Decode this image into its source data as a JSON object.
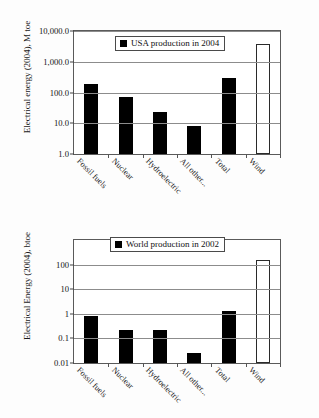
{
  "chart_data": [
    {
      "id": "usa-2004",
      "type": "bar",
      "title": "",
      "legend": "USA production in 2004",
      "legend_position": "top-left-inside",
      "xlabel": "",
      "ylabel": "Electrical energy (2004), M toe",
      "yscale": "log",
      "ylim": [
        1.0,
        10000.0
      ],
      "grid": true,
      "yticks": [
        "1.0",
        "10.0",
        "100.0",
        "1,000.0",
        "10,000.0"
      ],
      "ytick_values": [
        1.0,
        10.0,
        100.0,
        1000.0,
        10000.0
      ],
      "categories": [
        "Fossil fuels",
        "Nuclear",
        "Hydroelectric",
        "All other...",
        "Total",
        "Wind"
      ],
      "values": [
        190,
        70,
        24,
        8,
        290,
        3800
      ],
      "bar_styles": [
        "filled",
        "filled",
        "filled",
        "filled",
        "filled",
        "hollow"
      ]
    },
    {
      "id": "world-2002",
      "type": "bar",
      "title": "",
      "legend": "World production in 2002",
      "legend_position": "top-left-inside",
      "xlabel": "",
      "ylabel": "Electrical Energy (2004), btoe",
      "yscale": "log",
      "ylim": [
        0.01,
        1000
      ],
      "grid": true,
      "yticks": [
        "0.01",
        "0.1",
        "1",
        "10",
        "100"
      ],
      "ytick_values": [
        0.01,
        0.1,
        1,
        10,
        100
      ],
      "categories": [
        "Fossil fuels",
        "Nuclear",
        "Hydroelectric",
        "All other...",
        "Total",
        "Wind"
      ],
      "values": [
        0.85,
        0.21,
        0.22,
        0.025,
        1.3,
        150
      ],
      "bar_styles": [
        "filled",
        "filled",
        "filled",
        "filled",
        "filled",
        "hollow"
      ]
    }
  ],
  "colors": {
    "bar_fill": "#000000",
    "bar_hollow_fill": "#ffffff",
    "axis": "#5a5a5a",
    "grid": "#8c8c8c",
    "background": "#ffffff"
  }
}
